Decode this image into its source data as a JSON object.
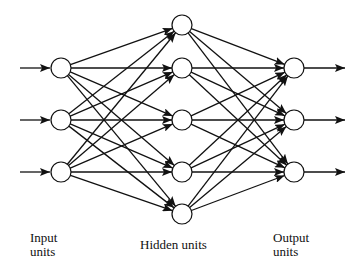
{
  "diagram": {
    "colors": {
      "stroke": "#111111",
      "node_fill": "#ffffff",
      "background": "#ffffff"
    },
    "node_radius": 10,
    "layers": [
      {
        "name": "input",
        "label_line1": "Input",
        "label_line2": "units",
        "x": 61,
        "ys": [
          68,
          120,
          172
        ]
      },
      {
        "name": "hidden",
        "label_line1": "Hidden units",
        "label_line2": "",
        "x": 182,
        "ys": [
          25,
          68,
          120,
          172,
          214
        ]
      },
      {
        "name": "output",
        "label_line1": "Output",
        "label_line2": "units",
        "x": 294,
        "ys": [
          68,
          120,
          172
        ]
      }
    ],
    "input_arrows": {
      "x_start": 20,
      "x_end": 50
    },
    "output_arrows": {
      "x_start": 304,
      "x_end": 345
    },
    "connectivity": "fully-connected"
  }
}
